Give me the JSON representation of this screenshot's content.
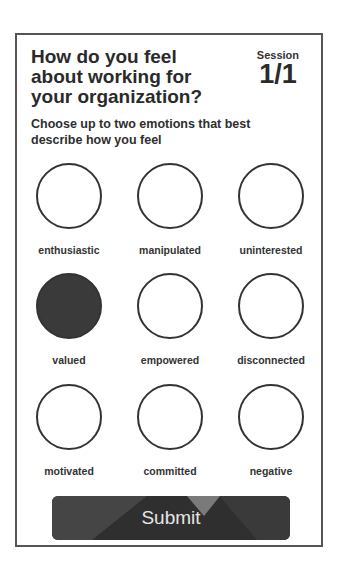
{
  "question": {
    "title": "How do you feel about working for your organization?",
    "instruction": "Choose up to two emotions that best describe how you feel"
  },
  "session": {
    "label": "Session",
    "value": "1/1"
  },
  "options": [
    {
      "label": "enthusiastic",
      "selected": false
    },
    {
      "label": "manipulated",
      "selected": false
    },
    {
      "label": "uninterested",
      "selected": false
    },
    {
      "label": "valued",
      "selected": true
    },
    {
      "label": "empowered",
      "selected": false
    },
    {
      "label": "disconnected",
      "selected": false
    },
    {
      "label": "motivated",
      "selected": false
    },
    {
      "label": "committed",
      "selected": false
    },
    {
      "label": "negative",
      "selected": false
    }
  ],
  "submit": {
    "label": "Submit"
  },
  "colors": {
    "selected_fill": "#3a3a3a",
    "button_base": "#3e3e3e",
    "button_accent": "#777777"
  }
}
